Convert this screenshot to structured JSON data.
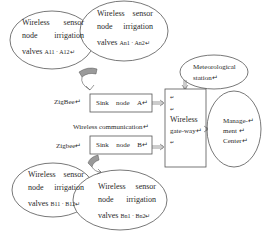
{
  "diagram": {
    "nodes": {
      "sensor_a1": {
        "line1_a": "Wireless",
        "line1_b": "sensor",
        "line2_a": "node",
        "line2_b": "irrigation",
        "line3_prefix": "valves",
        "line3_ids": "A11 · A12↵"
      },
      "sensor_a2": {
        "line1_a": "Wireless",
        "line1_b": "sensor",
        "line2_a": "node",
        "line2_b": "irrigation",
        "line3_prefix": "valves",
        "line3_ids": "An1 · An2↵"
      },
      "sensor_b1": {
        "line1_a": "Wireless",
        "line1_b": "sensor",
        "line2_a": "node",
        "line2_b": "irrigation",
        "line3_prefix": "valves",
        "line3_ids": "B11 · B12↵"
      },
      "sensor_b2": {
        "line1_a": "Wireless",
        "line1_b": "sensor",
        "line2_a": "node",
        "line2_b": "irrigation",
        "line3_prefix": "valves",
        "line3_ids": "Bn1 · Bn2↵"
      },
      "meteorological": {
        "line1": "Meteorological",
        "line2": "station↵"
      },
      "sink_a": {
        "w1": "Sink",
        "w2": "node",
        "w3": "A↵"
      },
      "sink_b": {
        "w1": "Sink",
        "w2": "node",
        "w3": "B↵"
      },
      "gateway": {
        "m1": "↵",
        "m2": "↵",
        "line1": "Wireless",
        "line2": "gate-way↵",
        "m3": "↵"
      },
      "management": {
        "line1": "Manage-↵",
        "line2": "ment ↵",
        "line3": "Center↵"
      }
    },
    "labels": {
      "zigbee_top": "ZigBee↵",
      "zigbee_bottom": "Zigbee↵",
      "wireless_comm": "Wireless communication↵"
    },
    "colors": {
      "stroke": "#555555",
      "arrow_fill": "#9a9a9a",
      "background": "#ffffff"
    }
  }
}
